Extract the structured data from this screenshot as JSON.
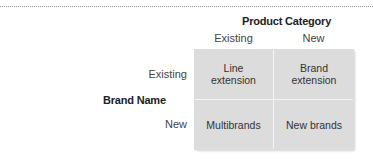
{
  "diagram": {
    "column_axis_title": "Product Category",
    "columns": [
      "Existing",
      "New"
    ],
    "row_axis_title": "Brand Name",
    "rows": [
      "Existing",
      "New"
    ],
    "cells": [
      [
        "Line\nextension",
        "Brand\nextension"
      ],
      [
        "Multibrands",
        "New brands"
      ]
    ],
    "colors": {
      "cell_fill": "#dcdcdc",
      "divider": "#f4f4f4"
    }
  }
}
